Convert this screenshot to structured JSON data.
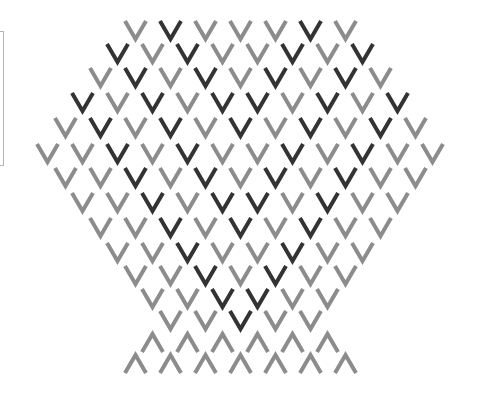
{
  "colors": {
    "dark": "#333333",
    "gray": "#8c8c8c",
    "background": "#ffffff",
    "panel_border": "#b5b5b5"
  },
  "layout": {
    "center_x": 240,
    "step_x": 35,
    "glyph_width": 25,
    "glyph_height": 21
  },
  "rows": [
    {
      "top": 20,
      "type": "chevron-down",
      "shades": [
        "gray",
        "dark",
        "gray",
        "gray",
        "gray",
        "dark",
        "gray"
      ]
    },
    {
      "top": 43,
      "type": "chevron-down",
      "shades": [
        "dark",
        "gray",
        "dark",
        "gray",
        "gray",
        "dark",
        "gray",
        "dark"
      ]
    },
    {
      "top": 67,
      "type": "chevron-down",
      "shades": [
        "gray",
        "dark",
        "gray",
        "dark",
        "gray",
        "dark",
        "gray",
        "dark",
        "gray"
      ]
    },
    {
      "top": 92,
      "type": "chevron-down",
      "shades": [
        "dark",
        "gray",
        "dark",
        "gray",
        "dark",
        "dark",
        "gray",
        "dark",
        "gray",
        "dark"
      ]
    },
    {
      "top": 117,
      "type": "chevron-down",
      "shades": [
        "gray",
        "dark",
        "gray",
        "dark",
        "gray",
        "dark",
        "gray",
        "dark",
        "gray",
        "dark",
        "gray"
      ]
    },
    {
      "top": 143,
      "type": "chevron-down",
      "shades": [
        "gray",
        "gray",
        "dark",
        "gray",
        "dark",
        "gray",
        "gray",
        "dark",
        "gray",
        "dark",
        "gray",
        "gray"
      ]
    },
    {
      "top": 167,
      "type": "chevron-down",
      "shades": [
        "gray",
        "gray",
        "dark",
        "gray",
        "dark",
        "gray",
        "dark",
        "gray",
        "dark",
        "gray",
        "gray"
      ]
    },
    {
      "top": 192,
      "type": "chevron-down",
      "shades": [
        "gray",
        "gray",
        "dark",
        "gray",
        "dark",
        "dark",
        "gray",
        "dark",
        "gray",
        "gray"
      ]
    },
    {
      "top": 217,
      "type": "chevron-down",
      "shades": [
        "gray",
        "gray",
        "dark",
        "gray",
        "dark",
        "gray",
        "dark",
        "gray",
        "gray"
      ]
    },
    {
      "top": 242,
      "type": "chevron-down",
      "shades": [
        "gray",
        "gray",
        "dark",
        "gray",
        "gray",
        "dark",
        "gray",
        "gray"
      ]
    },
    {
      "top": 265,
      "type": "chevron-down",
      "shades": [
        "gray",
        "gray",
        "dark",
        "gray",
        "dark",
        "gray",
        "gray"
      ]
    },
    {
      "top": 288,
      "type": "chevron-down",
      "shades": [
        "gray",
        "gray",
        "dark",
        "dark",
        "gray",
        "gray"
      ]
    },
    {
      "top": 310,
      "type": "chevron-down",
      "shades": [
        "gray",
        "gray",
        "dark",
        "gray",
        "gray"
      ]
    },
    {
      "top": 332,
      "type": "chevron-up",
      "shades": [
        "gray",
        "gray",
        "gray",
        "gray",
        "gray",
        "gray"
      ]
    },
    {
      "top": 353,
      "type": "chevron-up",
      "shades": [
        "gray",
        "gray",
        "gray",
        "gray",
        "gray",
        "gray",
        "gray"
      ]
    }
  ]
}
